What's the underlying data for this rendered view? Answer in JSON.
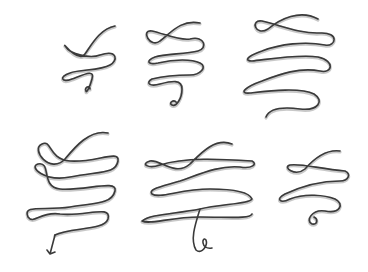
{
  "background_color": "#ffffff",
  "ink_color": "#3a3a3a",
  "shade_color": "#9a9a9a",
  "flourishes": [
    {
      "name": "flourish-small-double-loop",
      "loops": 2,
      "ending": "curl"
    },
    {
      "name": "flourish-triple-loop",
      "loops": 3,
      "ending": "curl"
    },
    {
      "name": "flourish-ornate-triple-loop",
      "loops": 3,
      "ending": "curl"
    },
    {
      "name": "flourish-heart-loops",
      "loops": 3,
      "ending": "arrow"
    },
    {
      "name": "flourish-wave-triple",
      "loops": 3,
      "ending": "curl"
    },
    {
      "name": "flourish-small-double-loop-right",
      "loops": 2,
      "ending": "curl"
    }
  ]
}
